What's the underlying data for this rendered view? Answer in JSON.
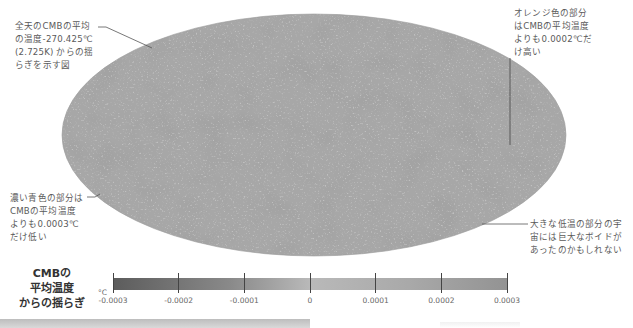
{
  "annotations": {
    "top_left": [
      "全天のCMBの平均",
      "の温度-270.425℃",
      "(2.725K) からの揺",
      "らぎを示す図"
    ],
    "top_right": [
      "オレンジ色の部分",
      "はCMBの平均温度",
      "よりも0.0002℃だ",
      "け高い"
    ],
    "bottom_left": [
      "濃い青色の部分は",
      "CMBの平均温度",
      "よりも0.0003℃",
      "だけ低い"
    ],
    "bottom_right": [
      "大きな低温の部分の宇",
      "宙には巨大なボイドが",
      "あったのかもしれない"
    ]
  },
  "legend": {
    "title_lines": [
      "CMBの",
      "平均温度",
      "からの揺らぎ"
    ],
    "unit": "°C",
    "ticks": [
      "-0.0003",
      "-0.0002",
      "-0.0001",
      "0",
      "0.0001",
      "0.0002",
      "0.0003"
    ]
  },
  "chart_data": {
    "type": "heatmap",
    "projection": "Mollweide (all-sky)",
    "colorbar": {
      "label": "°C",
      "range": [
        -0.0003,
        0.0003
      ],
      "ticks": [
        -0.0003,
        -0.0002,
        -0.0001,
        0,
        0.0001,
        0.0002,
        0.0003
      ]
    },
    "mean_temperature_celsius": -270.425,
    "mean_temperature_kelvin": 2.725
  }
}
